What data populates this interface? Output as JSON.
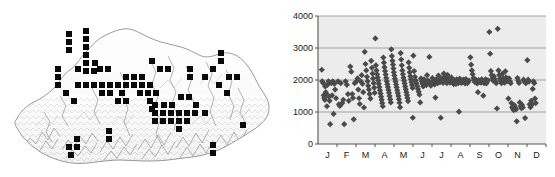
{
  "figure": {
    "panels": [
      {
        "id": "map-panel",
        "name": "distribution-map",
        "caption": ""
      },
      {
        "id": "chart-panel",
        "name": "elevation-scatter",
        "caption": ""
      }
    ]
  },
  "map": {
    "name": "bhutan-distribution-map",
    "region": "Bhutan",
    "outline_color": "#9a9a9a",
    "terrain_color": "#8c8c8c",
    "record_marker_color": "#0a0a0a",
    "record_marker_size_px": 6,
    "record_count": 84,
    "records": [
      [
        69,
        34
      ],
      [
        69,
        42
      ],
      [
        69,
        50
      ],
      [
        86,
        31
      ],
      [
        86,
        39
      ],
      [
        86,
        47
      ],
      [
        86,
        55
      ],
      [
        86,
        63
      ],
      [
        58,
        69
      ],
      [
        58,
        77
      ],
      [
        58,
        85
      ],
      [
        66,
        93
      ],
      [
        74,
        101
      ],
      [
        78,
        69
      ],
      [
        86,
        71
      ],
      [
        94,
        71
      ],
      [
        95,
        63
      ],
      [
        78,
        85
      ],
      [
        86,
        85
      ],
      [
        94,
        85
      ],
      [
        102,
        85
      ],
      [
        110,
        85
      ],
      [
        118,
        85
      ],
      [
        126,
        85
      ],
      [
        100,
        69
      ],
      [
        108,
        69
      ],
      [
        102,
        93
      ],
      [
        110,
        93
      ],
      [
        122,
        93
      ],
      [
        126,
        77
      ],
      [
        134,
        85
      ],
      [
        142,
        85
      ],
      [
        150,
        85
      ],
      [
        140,
        93
      ],
      [
        148,
        93
      ],
      [
        156,
        93
      ],
      [
        118,
        101
      ],
      [
        126,
        101
      ],
      [
        150,
        101
      ],
      [
        152,
        109
      ],
      [
        155,
        113
      ],
      [
        155,
        121
      ],
      [
        163,
        113
      ],
      [
        171,
        113
      ],
      [
        163,
        121
      ],
      [
        171,
        121
      ],
      [
        179,
        113
      ],
      [
        187,
        113
      ],
      [
        195,
        113
      ],
      [
        179,
        121
      ],
      [
        187,
        121
      ],
      [
        155,
        105
      ],
      [
        181,
        97
      ],
      [
        189,
        97
      ],
      [
        190,
        77
      ],
      [
        190,
        69
      ],
      [
        205,
        77
      ],
      [
        213,
        69
      ],
      [
        221,
        61
      ],
      [
        221,
        53
      ],
      [
        219,
        85
      ],
      [
        227,
        93
      ],
      [
        229,
        77
      ],
      [
        243,
        125
      ],
      [
        213,
        145
      ],
      [
        213,
        153
      ],
      [
        179,
        129
      ],
      [
        109,
        131
      ],
      [
        109,
        139
      ],
      [
        69,
        147
      ],
      [
        77,
        147
      ],
      [
        71,
        155
      ],
      [
        77,
        139
      ],
      [
        134,
        77
      ],
      [
        142,
        77
      ],
      [
        164,
        105
      ],
      [
        172,
        105
      ],
      [
        196,
        105
      ],
      [
        205,
        113
      ],
      [
        160,
        69
      ],
      [
        168,
        69
      ],
      [
        152,
        61
      ],
      [
        237,
        77
      ]
    ]
  },
  "chart_data": {
    "type": "scatter",
    "name": "elevation-by-month-scatter",
    "title": "",
    "xlabel": "",
    "ylabel": "",
    "xlim": [
      0,
      12
    ],
    "ylim": [
      0,
      4000
    ],
    "yticks": [
      0,
      1000,
      2000,
      3000,
      4000
    ],
    "ytick_labels": [
      "0",
      "1000",
      "2000",
      "3000",
      "4000"
    ],
    "xtick_labels": [
      "J",
      "F",
      "M",
      "A",
      "M",
      "J",
      "J",
      "A",
      "S",
      "O",
      "N",
      "D"
    ],
    "grid": true,
    "gridlines_y": [
      1000,
      2000,
      3000,
      4000
    ],
    "legend": "none",
    "marker": "diamond",
    "marker_color": "#4a4a4a",
    "marker_size_px": 5,
    "plot_bg_color": "#ececec",
    "axis_color": "#555555",
    "gridline_color": "#9a9a9a",
    "point_count": 274,
    "points": [
      [
        0.2,
        2320
      ],
      [
        0.22,
        1960
      ],
      [
        0.28,
        1900
      ],
      [
        0.3,
        1520
      ],
      [
        0.33,
        1440
      ],
      [
        0.36,
        1380
      ],
      [
        0.38,
        1800
      ],
      [
        0.41,
        1620
      ],
      [
        0.44,
        1560
      ],
      [
        0.47,
        1180
      ],
      [
        0.5,
        1850
      ],
      [
        0.55,
        1960
      ],
      [
        0.58,
        1480
      ],
      [
        0.61,
        1350
      ],
      [
        0.64,
        620
      ],
      [
        0.7,
        1900
      ],
      [
        0.74,
        1520
      ],
      [
        0.78,
        1960
      ],
      [
        0.82,
        940
      ],
      [
        0.86,
        1880
      ],
      [
        0.9,
        1700
      ],
      [
        0.95,
        1430
      ],
      [
        1.05,
        1960
      ],
      [
        1.1,
        1240
      ],
      [
        1.15,
        1190
      ],
      [
        1.2,
        1900
      ],
      [
        1.28,
        1280
      ],
      [
        1.33,
        1380
      ],
      [
        1.38,
        620
      ],
      [
        1.45,
        1960
      ],
      [
        1.52,
        1850
      ],
      [
        1.58,
        1560
      ],
      [
        1.62,
        1350
      ],
      [
        1.7,
        2420
      ],
      [
        1.75,
        2260
      ],
      [
        1.8,
        1560
      ],
      [
        1.84,
        1440
      ],
      [
        1.88,
        770
      ],
      [
        1.93,
        1900
      ],
      [
        2.03,
        1960
      ],
      [
        2.08,
        2050
      ],
      [
        2.12,
        1700
      ],
      [
        2.16,
        1430
      ],
      [
        2.2,
        1250
      ],
      [
        2.25,
        1960
      ],
      [
        2.3,
        2150
      ],
      [
        2.34,
        1880
      ],
      [
        2.38,
        1620
      ],
      [
        2.42,
        1140
      ],
      [
        2.46,
        2880
      ],
      [
        2.5,
        2500
      ],
      [
        2.54,
        2300
      ],
      [
        2.58,
        2100
      ],
      [
        2.61,
        1960
      ],
      [
        2.64,
        1820
      ],
      [
        2.68,
        1700
      ],
      [
        2.72,
        1560
      ],
      [
        2.76,
        1420
      ],
      [
        2.8,
        2600
      ],
      [
        2.84,
        2380
      ],
      [
        2.87,
        2200
      ],
      [
        2.9,
        2050
      ],
      [
        2.93,
        1900
      ],
      [
        2.96,
        1760
      ],
      [
        2.98,
        1600
      ],
      [
        3.02,
        3300
      ],
      [
        3.05,
        2460
      ],
      [
        3.08,
        2300
      ],
      [
        3.11,
        2180
      ],
      [
        3.14,
        2080
      ],
      [
        3.17,
        1980
      ],
      [
        3.2,
        1880
      ],
      [
        3.23,
        1780
      ],
      [
        3.26,
        1680
      ],
      [
        3.29,
        1580
      ],
      [
        3.32,
        1480
      ],
      [
        3.35,
        1380
      ],
      [
        3.38,
        1280
      ],
      [
        3.41,
        1180
      ],
      [
        3.44,
        2700
      ],
      [
        3.47,
        2540
      ],
      [
        3.5,
        2400
      ],
      [
        3.53,
        2280
      ],
      [
        3.56,
        2170
      ],
      [
        3.59,
        2060
      ],
      [
        3.62,
        1960
      ],
      [
        3.65,
        1870
      ],
      [
        3.68,
        1780
      ],
      [
        3.71,
        1690
      ],
      [
        3.74,
        1600
      ],
      [
        3.77,
        1500
      ],
      [
        3.8,
        1400
      ],
      [
        3.83,
        1300
      ],
      [
        3.86,
        2960
      ],
      [
        3.89,
        2750
      ],
      [
        3.92,
        2600
      ],
      [
        3.95,
        2480
      ],
      [
        3.97,
        2360
      ],
      [
        3.99,
        2240
      ],
      [
        4.02,
        2140
      ],
      [
        4.05,
        2040
      ],
      [
        4.08,
        1950
      ],
      [
        4.11,
        1860
      ],
      [
        4.14,
        1770
      ],
      [
        4.17,
        1680
      ],
      [
        4.2,
        1590
      ],
      [
        4.23,
        1500
      ],
      [
        4.26,
        1400
      ],
      [
        4.29,
        1290
      ],
      [
        4.32,
        1150
      ],
      [
        4.35,
        2840
      ],
      [
        4.38,
        2640
      ],
      [
        4.41,
        2460
      ],
      [
        4.44,
        2300
      ],
      [
        4.47,
        2180
      ],
      [
        4.5,
        2070
      ],
      [
        4.53,
        1980
      ],
      [
        4.56,
        1890
      ],
      [
        4.59,
        1800
      ],
      [
        4.62,
        1710
      ],
      [
        4.65,
        1620
      ],
      [
        4.68,
        1530
      ],
      [
        4.71,
        1440
      ],
      [
        4.74,
        1340
      ],
      [
        4.77,
        2550
      ],
      [
        4.8,
        2380
      ],
      [
        4.83,
        2240
      ],
      [
        4.86,
        2120
      ],
      [
        4.89,
        2020
      ],
      [
        4.92,
        1930
      ],
      [
        4.95,
        1840
      ],
      [
        4.98,
        1750
      ],
      [
        4.99,
        820
      ],
      [
        5.02,
        2760
      ],
      [
        5.06,
        2280
      ],
      [
        5.1,
        2100
      ],
      [
        5.14,
        1990
      ],
      [
        5.18,
        1900
      ],
      [
        5.22,
        1810
      ],
      [
        5.26,
        1720
      ],
      [
        5.3,
        1630
      ],
      [
        5.34,
        1540
      ],
      [
        5.38,
        1300
      ],
      [
        5.42,
        2050
      ],
      [
        5.46,
        1960
      ],
      [
        5.5,
        1880
      ],
      [
        5.54,
        1800
      ],
      [
        5.58,
        2020
      ],
      [
        5.62,
        1960
      ],
      [
        5.66,
        1900
      ],
      [
        5.7,
        1840
      ],
      [
        5.74,
        2150
      ],
      [
        5.78,
        1990
      ],
      [
        5.82,
        1930
      ],
      [
        5.86,
        2720
      ],
      [
        5.9,
        1880
      ],
      [
        5.94,
        1820
      ],
      [
        6.02,
        2060
      ],
      [
        6.06,
        1980
      ],
      [
        6.1,
        1920
      ],
      [
        6.14,
        1860
      ],
      [
        6.18,
        1450
      ],
      [
        6.22,
        2020
      ],
      [
        6.26,
        1960
      ],
      [
        6.3,
        1900
      ],
      [
        6.34,
        2140
      ],
      [
        6.38,
        1990
      ],
      [
        6.42,
        1930
      ],
      [
        6.46,
        820
      ],
      [
        6.5,
        2050
      ],
      [
        6.54,
        1970
      ],
      [
        6.58,
        1910
      ],
      [
        6.62,
        2200
      ],
      [
        6.66,
        2100
      ],
      [
        6.7,
        2020
      ],
      [
        6.74,
        1960
      ],
      [
        6.78,
        1900
      ],
      [
        6.82,
        2160
      ],
      [
        6.86,
        2050
      ],
      [
        6.9,
        1980
      ],
      [
        6.94,
        1920
      ],
      [
        7.02,
        2080
      ],
      [
        7.06,
        1990
      ],
      [
        7.1,
        1930
      ],
      [
        7.14,
        1870
      ],
      [
        7.18,
        2000
      ],
      [
        7.22,
        1940
      ],
      [
        7.26,
        1880
      ],
      [
        7.3,
        2020
      ],
      [
        7.34,
        1960
      ],
      [
        7.38,
        1900
      ],
      [
        7.42,
        1010
      ],
      [
        7.46,
        2040
      ],
      [
        7.5,
        1970
      ],
      [
        7.54,
        1910
      ],
      [
        7.58,
        1990
      ],
      [
        7.62,
        1930
      ],
      [
        7.66,
        2010
      ],
      [
        7.7,
        1950
      ],
      [
        7.74,
        1890
      ],
      [
        7.78,
        2030
      ],
      [
        7.82,
        1960
      ],
      [
        7.86,
        1900
      ],
      [
        7.9,
        1940
      ],
      [
        7.94,
        1980
      ],
      [
        8.02,
        2710
      ],
      [
        8.06,
        2480
      ],
      [
        8.1,
        2300
      ],
      [
        8.14,
        2180
      ],
      [
        8.18,
        2060
      ],
      [
        8.22,
        1990
      ],
      [
        8.26,
        1930
      ],
      [
        8.3,
        2010
      ],
      [
        8.34,
        1950
      ],
      [
        8.38,
        1890
      ],
      [
        8.42,
        1620
      ],
      [
        8.46,
        2000
      ],
      [
        8.5,
        1940
      ],
      [
        8.54,
        1980
      ],
      [
        8.58,
        1920
      ],
      [
        8.62,
        2020
      ],
      [
        8.66,
        1960
      ],
      [
        8.7,
        1510
      ],
      [
        8.74,
        1900
      ],
      [
        8.78,
        1960
      ],
      [
        8.82,
        2020
      ],
      [
        8.86,
        1890
      ],
      [
        8.9,
        1950
      ],
      [
        8.94,
        1990
      ],
      [
        9.02,
        3500
      ],
      [
        9.06,
        2820
      ],
      [
        9.1,
        2280
      ],
      [
        9.14,
        2150
      ],
      [
        9.18,
        2050
      ],
      [
        9.22,
        1980
      ],
      [
        9.26,
        2120
      ],
      [
        9.3,
        2030
      ],
      [
        9.34,
        1960
      ],
      [
        9.38,
        1900
      ],
      [
        9.42,
        1110
      ],
      [
        9.46,
        3600
      ],
      [
        9.5,
        2300
      ],
      [
        9.54,
        2160
      ],
      [
        9.58,
        2050
      ],
      [
        9.62,
        1970
      ],
      [
        9.66,
        1900
      ],
      [
        9.7,
        2190
      ],
      [
        9.74,
        2060
      ],
      [
        9.78,
        1980
      ],
      [
        9.82,
        1920
      ],
      [
        9.86,
        2270
      ],
      [
        9.9,
        2080
      ],
      [
        9.94,
        1960
      ],
      [
        10.02,
        1420
      ],
      [
        10.06,
        2050
      ],
      [
        10.1,
        1960
      ],
      [
        10.14,
        1900
      ],
      [
        10.18,
        1280
      ],
      [
        10.22,
        1150
      ],
      [
        10.26,
        1100
      ],
      [
        10.3,
        1060
      ],
      [
        10.34,
        1210
      ],
      [
        10.38,
        1130
      ],
      [
        10.42,
        1080
      ],
      [
        10.46,
        710
      ],
      [
        10.5,
        2060
      ],
      [
        10.54,
        1970
      ],
      [
        10.58,
        1910
      ],
      [
        10.62,
        1300
      ],
      [
        10.66,
        1180
      ],
      [
        10.7,
        1120
      ],
      [
        10.74,
        1220
      ],
      [
        10.78,
        1140
      ],
      [
        10.82,
        2010
      ],
      [
        10.86,
        1950
      ],
      [
        10.9,
        810
      ],
      [
        10.94,
        1900
      ],
      [
        11.02,
        2620
      ],
      [
        11.06,
        2010
      ],
      [
        11.1,
        1950
      ],
      [
        11.14,
        1240
      ],
      [
        11.18,
        1150
      ],
      [
        11.22,
        1350
      ],
      [
        11.26,
        1230
      ],
      [
        11.3,
        1720
      ],
      [
        11.34,
        1960
      ],
      [
        11.38,
        1900
      ],
      [
        11.42,
        1420
      ],
      [
        11.46,
        1280
      ]
    ]
  }
}
